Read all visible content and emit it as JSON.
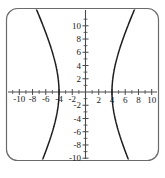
{
  "figure": {
    "frame_color": "#6b6b6b",
    "background_color": "#ffffff",
    "caption": ""
  },
  "chart_data": {
    "type": "line",
    "title": "",
    "subtitle": "",
    "xlabel": "",
    "ylabel": "",
    "xlim": [
      -11.3,
      11.3
    ],
    "ylim": [
      -11.3,
      11.3
    ],
    "grid": false,
    "legend": null,
    "axis_color": "#4a4a4a",
    "curve_color": "#1c1c1c",
    "xticks": [
      -10,
      -8,
      -6,
      -4,
      -2,
      2,
      4,
      6,
      8,
      10
    ],
    "yticks": [
      -10,
      -8,
      -6,
      -4,
      -2,
      2,
      4,
      6,
      8,
      10
    ],
    "xtick_labels": [
      "-10",
      "-8",
      "-6",
      "-4",
      "-2",
      "2",
      "4",
      "6",
      "8",
      "10"
    ],
    "ytick_labels": [
      "-10",
      "-8",
      "-6",
      "-4",
      "-2",
      "2",
      "4",
      "6",
      "8",
      "10"
    ],
    "minor_tick_interval": 1,
    "equation": "x^2/16 - y^2/64 = 1",
    "curve_name": "hyperbola",
    "orientation": "horizontal",
    "center": [
      0,
      0
    ],
    "vertices": [
      [
        -4,
        0
      ],
      [
        4,
        0
      ]
    ],
    "semi_axis_a": 4,
    "semi_axis_b": 8,
    "asymptote_slopes": [
      2,
      -2
    ],
    "series": [
      {
        "name": "right-branch-upper",
        "x": [
          4,
          4.05,
          4.2,
          4.5,
          5,
          5.5,
          6,
          6.5,
          7,
          7.5,
          8,
          8.5,
          9,
          9.5,
          10,
          10.5,
          11
        ],
        "y": [
          0,
          1.27,
          2.56,
          3.67,
          6.0,
          7.55,
          8.94,
          10.24,
          11.49,
          12.69,
          13.86,
          15.0,
          16.12,
          17.23,
          18.33,
          19.41,
          20.49
        ]
      },
      {
        "name": "right-branch-lower",
        "x": [
          4,
          4.05,
          4.2,
          4.5,
          5,
          5.5,
          6,
          6.5,
          7,
          7.5,
          8,
          8.5,
          9,
          9.5,
          10,
          10.5,
          11
        ],
        "y": [
          0,
          -1.27,
          -2.56,
          -3.67,
          -6.0,
          -7.55,
          -8.94,
          -10.24,
          -11.49,
          -12.69,
          -13.86,
          -15.0,
          -16.12,
          -17.23,
          -18.33,
          -19.41,
          -20.49
        ]
      },
      {
        "name": "left-branch-upper",
        "x": [
          -4,
          -4.05,
          -4.2,
          -4.5,
          -5,
          -5.5,
          -6,
          -6.5,
          -7,
          -7.5,
          -8,
          -8.5,
          -9,
          -9.5,
          -10,
          -10.5,
          -11
        ],
        "y": [
          0,
          1.27,
          2.56,
          3.67,
          6.0,
          7.55,
          8.94,
          10.24,
          11.49,
          12.69,
          13.86,
          15.0,
          16.12,
          17.23,
          18.33,
          19.41,
          20.49
        ]
      },
      {
        "name": "left-branch-lower",
        "x": [
          -4,
          -4.05,
          -4.2,
          -4.5,
          -5,
          -5.5,
          -6,
          -6.5,
          -7,
          -7.5,
          -8,
          -8.5,
          -9,
          -9.5,
          -10,
          -10.5,
          -11
        ],
        "y": [
          0,
          -1.27,
          -2.56,
          -3.67,
          -6.0,
          -7.55,
          -8.94,
          -10.24,
          -11.49,
          -12.69,
          -13.86,
          -15.0,
          -16.12,
          -17.23,
          -18.33,
          -19.41,
          -20.49
        ]
      }
    ]
  }
}
